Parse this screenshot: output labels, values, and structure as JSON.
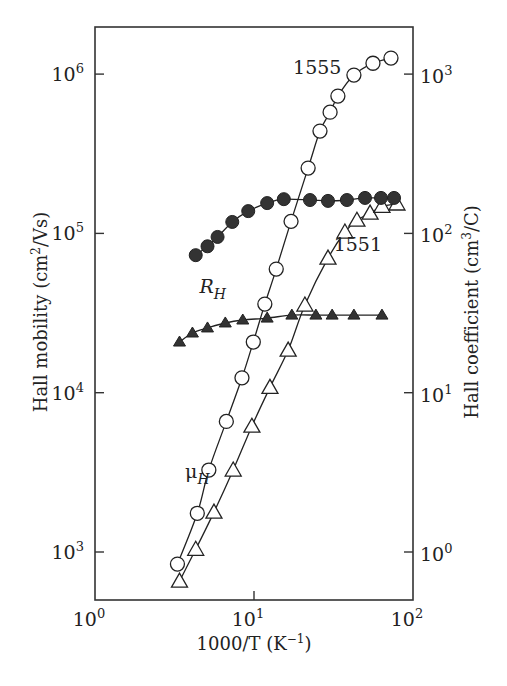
{
  "chart_data": {
    "type": "scatter",
    "title": "",
    "xlabel": "1000/T (K⁻¹)",
    "ylabel": "Hall mobility (cm²/Vs)",
    "y2label": "Hall coefficient (cm³/C)",
    "xscale": "log",
    "yscale": "log",
    "y2scale": "log",
    "xlim": [
      1,
      100
    ],
    "ylim": [
      500,
      2000000
    ],
    "y2lim": [
      0.5,
      2000
    ],
    "grid": false,
    "legend": "none",
    "x_ticks": [
      {
        "value": 1,
        "base": "10",
        "exp": "0"
      },
      {
        "value": 10,
        "base": "10",
        "exp": "1"
      },
      {
        "value": 100,
        "base": "10",
        "exp": "2"
      }
    ],
    "y_ticks": [
      {
        "value": 1000,
        "base": "10",
        "exp": "3"
      },
      {
        "value": 10000,
        "base": "10",
        "exp": "4"
      },
      {
        "value": 100000,
        "base": "10",
        "exp": "5"
      },
      {
        "value": 1000000,
        "base": "10",
        "exp": "6"
      }
    ],
    "y2_ticks": [
      {
        "value": 1,
        "base": "10",
        "exp": "0"
      },
      {
        "value": 10,
        "base": "10",
        "exp": "1"
      },
      {
        "value": 100,
        "base": "10",
        "exp": "2"
      },
      {
        "value": 1000,
        "base": "10",
        "exp": "3"
      }
    ],
    "series": [
      {
        "name": "μ_H sample 1555",
        "quantity": "Hall mobility",
        "axis": "left",
        "marker": "open-circle",
        "x": [
          3.3,
          4.4,
          5.2,
          6.7,
          8.4,
          9.9,
          11.7,
          13.8,
          17.1,
          21.9,
          26.0,
          30.1,
          33.7,
          42.5,
          56.0,
          72.7
        ],
        "y": [
          840,
          1750,
          3270,
          6600,
          12400,
          20800,
          36000,
          59700,
          119000,
          257000,
          439000,
          577000,
          728000,
          986000,
          1170000,
          1260000
        ]
      },
      {
        "name": "μ_H sample 1551",
        "quantity": "Hall mobility",
        "axis": "left",
        "marker": "open-triangle",
        "x": [
          3.4,
          4.3,
          5.6,
          7.4,
          9.7,
          12.6,
          16.4,
          20.9,
          29.2,
          37.3,
          44.4,
          53.7,
          63.8,
          79.3
        ],
        "y": [
          656,
          1040,
          1780,
          3270,
          6160,
          10800,
          18500,
          35500,
          70000,
          102000,
          121000,
          134000,
          148000,
          153000
        ]
      },
      {
        "name": "R_H sample 1555",
        "quantity": "Hall coefficient",
        "axis": "right",
        "marker": "filled-circle",
        "x": [
          4.3,
          5.1,
          5.9,
          7.3,
          9.2,
          12.1,
          15.4,
          22.5,
          29.2,
          38.4,
          49.9,
          62.9,
          76.0
        ],
        "y": [
          73,
          83,
          95,
          118,
          138,
          155,
          164,
          162,
          160,
          162,
          167,
          167,
          167
        ]
      },
      {
        "name": "R_H sample 1551",
        "quantity": "Hall coefficient",
        "axis": "right",
        "marker": "filled-triangle",
        "x": [
          3.4,
          4.1,
          5.1,
          6.6,
          8.5,
          12.1,
          17.3,
          24.5,
          31.0,
          42.5,
          63.8
        ],
        "y": [
          20.8,
          23.7,
          25.5,
          27.4,
          28.6,
          29.4,
          30.7,
          30.7,
          30.7,
          30.7,
          30.7
        ]
      }
    ],
    "annotations": [
      {
        "id": "label-1555",
        "text": "1555",
        "x": 25,
        "y_left": 1000000
      },
      {
        "id": "label-1551",
        "text": "1551",
        "x": 45,
        "y_left": 78000
      },
      {
        "id": "label-RH",
        "text": "R",
        "sub": "H",
        "x": 5.5,
        "y_left": 42000
      },
      {
        "id": "label-muH",
        "text": "μ",
        "sub": "H",
        "x": 4.4,
        "y_left": 2900
      }
    ]
  }
}
